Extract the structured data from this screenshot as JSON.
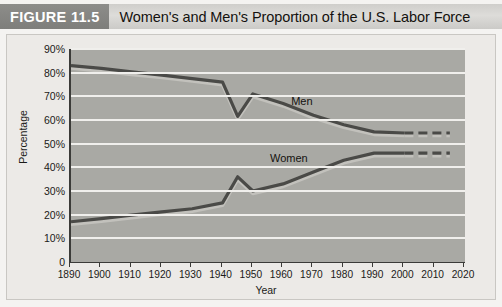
{
  "figure": {
    "tag": "FIGURE 11.5",
    "title": "Women's and Men's Proportion of the U.S. Labor Force"
  },
  "colors": {
    "tag_background": "#7e7e7b",
    "title_background": "#d5d4d1",
    "plot_background": "#a9a9a4",
    "gridline": "#f0efec",
    "line_dark": "#4a4a47",
    "line_light": "#c2c1bc",
    "axis": "#3b3b38",
    "text": "#1b1a18"
  },
  "chart_data": {
    "type": "line",
    "title": "Women's and Men's Proportion of the U.S. Labor Force",
    "xlabel": "Year",
    "ylabel": "Percentage",
    "xlim": [
      1890,
      2020
    ],
    "ylim": [
      0,
      90
    ],
    "grid": true,
    "legend_position": "inline-annotation",
    "xticks": [
      1890,
      1900,
      1910,
      1920,
      1930,
      1940,
      1950,
      1960,
      1970,
      1980,
      1990,
      2000,
      2010,
      2020
    ],
    "xtick_labels": [
      "1890",
      "1900",
      "1910",
      "1920",
      "1930",
      "1940",
      "1950",
      "1960",
      "1970",
      "1980",
      "1990",
      "2000",
      "2010",
      "2020"
    ],
    "yticks": [
      0,
      10,
      20,
      30,
      40,
      50,
      60,
      70,
      80,
      90
    ],
    "ytick_labels": [
      "0",
      "10%",
      "20%",
      "30%",
      "40%",
      "50%",
      "60%",
      "70%",
      "80%",
      "90%"
    ],
    "series": [
      {
        "name": "Men",
        "label": "Men",
        "x": [
          1890,
          1900,
          1910,
          1920,
          1930,
          1940,
          1945,
          1950,
          1960,
          1970,
          1980,
          1990,
          2000
        ],
        "values": [
          83.0,
          81.8,
          80.3,
          79.0,
          77.5,
          76.0,
          61.5,
          71.0,
          67.0,
          62.0,
          58.0,
          55.0,
          54.5
        ],
        "projection_x": [
          2000,
          2005,
          2010,
          2015
        ],
        "projection_values": [
          54.5,
          54.5,
          54.5,
          54.5
        ]
      },
      {
        "name": "Women",
        "label": "Women",
        "x": [
          1890,
          1900,
          1910,
          1920,
          1930,
          1940,
          1945,
          1950,
          1960,
          1970,
          1980,
          1990,
          2000
        ],
        "values": [
          17.0,
          18.3,
          19.8,
          21.2,
          22.5,
          25.0,
          36.0,
          30.0,
          33.0,
          38.0,
          43.0,
          46.0,
          46.0
        ],
        "projection_x": [
          2000,
          2005,
          2010,
          2015
        ],
        "projection_values": [
          46.0,
          46.0,
          46.0,
          46.0
        ]
      }
    ]
  }
}
